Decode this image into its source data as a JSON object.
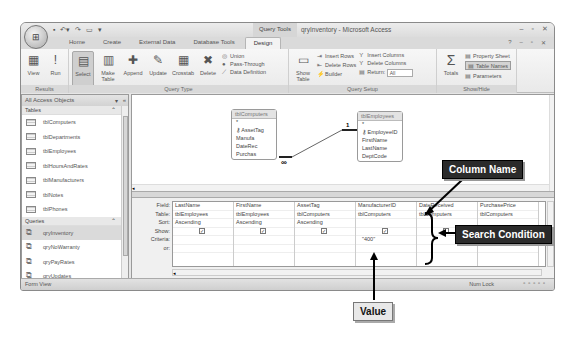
{
  "window": {
    "title": "qryInventory - Microsoft Access",
    "contextual_tab_group": "Query Tools",
    "quick_access": [
      "save-icon",
      "undo-icon",
      "redo-icon",
      "print-icon",
      "customize-icon"
    ],
    "controls": [
      "minimize",
      "maximize",
      "close"
    ]
  },
  "tabs": [
    {
      "label": "Home",
      "active": false
    },
    {
      "label": "Create",
      "active": false
    },
    {
      "label": "External Data",
      "active": false
    },
    {
      "label": "Database Tools",
      "active": false
    },
    {
      "label": "Design",
      "active": true
    }
  ],
  "ribbon": {
    "results": {
      "label": "Results",
      "buttons": [
        {
          "label": "View",
          "icon": "datasheet-view-icon"
        },
        {
          "label": "Run",
          "icon": "run-exclamation-icon"
        }
      ]
    },
    "query_type": {
      "label": "Query Type",
      "buttons": [
        {
          "label": "Select",
          "selected": true
        },
        {
          "label": "Make Table",
          "selected": false
        },
        {
          "label": "Append",
          "selected": false
        },
        {
          "label": "Update",
          "selected": false
        },
        {
          "label": "Crosstab",
          "selected": false
        },
        {
          "label": "Delete",
          "selected": false
        }
      ],
      "small": [
        "Union",
        "Pass-Through",
        "Data Definition"
      ]
    },
    "query_setup": {
      "label": "Query Setup",
      "show_table": "Show Table",
      "col1": [
        "Insert Rows",
        "Delete Rows",
        "Builder"
      ],
      "col2": [
        "Insert Columns",
        "Delete Columns",
        "Return:"
      ],
      "return_value": "All"
    },
    "show_hide": {
      "label": "Show/Hide",
      "totals": "Totals",
      "items": [
        {
          "label": "Property Sheet",
          "active": false
        },
        {
          "label": "Table Names",
          "active": true
        },
        {
          "label": "Parameters",
          "active": false
        }
      ]
    }
  },
  "nav": {
    "header": "All Access Objects",
    "sections": [
      {
        "title": "Tables",
        "items": [
          "tblComputers",
          "tblDepartments",
          "tblEmployees",
          "tblHoursAndRates",
          "tblManufacturers",
          "tblNotes",
          "tblPhones"
        ]
      },
      {
        "title": "Queries",
        "items": [
          "qryInventory",
          "qryNoWarranty",
          "qryPayRates",
          "qryUpdates",
          "qryWeeklyInfo"
        ],
        "active": "qryInventory"
      }
    ]
  },
  "design": {
    "tables": [
      {
        "name": "tblComputers",
        "fields": [
          "*",
          "AssetTag",
          "Manufa",
          "DateRec",
          "Purchas"
        ],
        "key": "AssetTag"
      },
      {
        "name": "tblEmployees",
        "fields": [
          "*",
          "EmployeeID",
          "FirstName",
          "LastName",
          "DeptCode"
        ],
        "key": "EmployeeID"
      }
    ],
    "relationship": {
      "one": "1",
      "many": "∞"
    },
    "row_labels": [
      "Field:",
      "Table:",
      "Sort:",
      "Show:",
      "Criteria:",
      "or:"
    ],
    "columns": [
      {
        "field": "LastName",
        "table": "tblEmployees",
        "sort": "Ascending",
        "show": true,
        "criteria": ""
      },
      {
        "field": "FirstName",
        "table": "tblEmployees",
        "sort": "Ascending",
        "show": true,
        "criteria": ""
      },
      {
        "field": "AssetTag",
        "table": "tblComputers",
        "sort": "Ascending",
        "show": true,
        "criteria": ""
      },
      {
        "field": "ManufacturerID",
        "table": "tblComputers",
        "sort": "",
        "show": true,
        "criteria": "\"400\""
      },
      {
        "field": "DateReceived",
        "table": "tblComputers",
        "sort": "",
        "show": false,
        "criteria": ""
      },
      {
        "field": "PurchasePrice",
        "table": "tblComputers",
        "sort": "",
        "show": false,
        "criteria": ""
      }
    ]
  },
  "status": {
    "left": "Form View",
    "right": "Num Lock"
  },
  "callouts": {
    "column_name": "Column Name",
    "search_condition": "Search Condition",
    "value": "Value"
  }
}
